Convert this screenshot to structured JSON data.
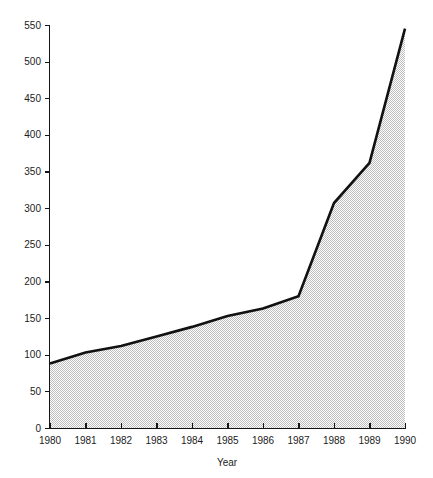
{
  "chart_data": {
    "type": "area",
    "title": "",
    "xlabel": "Year",
    "ylabel": "",
    "categories": [
      1980,
      1981,
      1982,
      1983,
      1984,
      1985,
      1986,
      1987,
      1988,
      1989,
      1990
    ],
    "values": [
      88,
      103,
      112,
      125,
      138,
      153,
      163,
      180,
      307,
      362,
      545
    ],
    "xtick_labels": [
      "1980",
      "1981",
      "1982",
      "1983",
      "1984",
      "1985",
      "1986",
      "1987",
      "1988",
      "1989",
      "1990"
    ],
    "ytick_labels": [
      "0",
      "50",
      "100",
      "150",
      "200",
      "250",
      "300",
      "350",
      "400",
      "450",
      "500",
      "550"
    ],
    "ytick_values": [
      0,
      50,
      100,
      150,
      200,
      250,
      300,
      350,
      400,
      450,
      500,
      550
    ],
    "xlim": [
      1980,
      1990
    ],
    "ylim": [
      0,
      550
    ],
    "grid": false,
    "legend": false,
    "colors": {
      "line": "#111111",
      "area_fill": "#d6d6d6",
      "axis": "#151515",
      "text": "#1c1c1c",
      "background": "#ffffff"
    }
  }
}
